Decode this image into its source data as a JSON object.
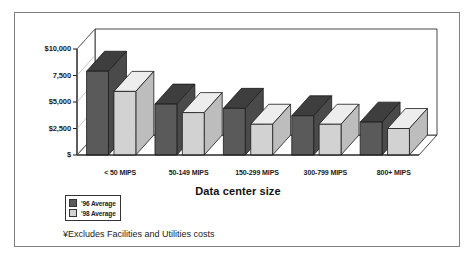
{
  "chart_data": {
    "type": "bar",
    "title": "",
    "xlabel": "Data center size",
    "ylabel": "",
    "categories": [
      "< 50 MIPS",
      "50-149 MIPS",
      "150-299 MIPS",
      "300-799 MIPS",
      "800+ MIPS"
    ],
    "series": [
      {
        "name": "'96 Average",
        "color": "#5a5a5a",
        "values": [
          7900,
          4800,
          4400,
          3700,
          3100
        ]
      },
      {
        "name": "'98 Average",
        "color": "#d2d2d2",
        "values": [
          6000,
          4000,
          2900,
          2900,
          2500
        ]
      }
    ],
    "ylim": [
      0,
      10000
    ],
    "yticks": [
      0,
      2500,
      5000,
      7500,
      10000
    ],
    "ytick_labels": [
      "$",
      "$2,500",
      "$5,000",
      "7,500",
      "$10,000"
    ],
    "grid": false,
    "legend_position": "below-left",
    "style": "3d-bars"
  },
  "footnote": {
    "text": "¥Excludes Facilities and Utilities costs"
  },
  "colors": {
    "series_96": "#5a5a5a",
    "series_96_top": "#3e3e3e",
    "series_96_side": "#4a4a4a",
    "series_98": "#d2d2d2",
    "series_98_top": "#ededed",
    "series_98_side": "#bdbdbd",
    "outline": "#1a1a1a",
    "frame": "#808080",
    "background": "#ffffff"
  }
}
